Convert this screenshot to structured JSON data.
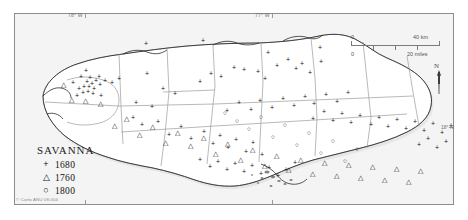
{
  "figure": {
    "credit": "© Carto ANU 08-004"
  },
  "legend": {
    "title": "SAVANNA",
    "entries": [
      {
        "symbol": "+",
        "glyph_name": "plus-symbol",
        "label": "1680"
      },
      {
        "symbol": "△",
        "glyph_name": "triangle-symbol",
        "label": "1760"
      },
      {
        "symbol": "○",
        "glyph_name": "circle-symbol",
        "label": "1800"
      }
    ]
  },
  "graticule": {
    "longitude_labels": [
      {
        "text": "78° W",
        "x": 70
      },
      {
        "text": "77° W",
        "x": 257
      }
    ],
    "latitude_labels": [
      {
        "text": "18° N",
        "y": 126
      }
    ]
  },
  "scale_bar": {
    "km_min": "0",
    "km_max": "40 km",
    "mi_min": "0",
    "mi_max": "20 miles"
  },
  "north_arrow": {
    "label": "N"
  },
  "chart_data": {
    "type": "scatter",
    "title": "SAVANNA",
    "xlabel": "Longitude",
    "ylabel": "Latitude",
    "series": [
      {
        "name": "1680",
        "symbol": "+",
        "points": [
          [
            65,
            66
          ],
          [
            72,
            70
          ],
          [
            78,
            66
          ],
          [
            82,
            72
          ],
          [
            69,
            76
          ],
          [
            74,
            77
          ],
          [
            79,
            74
          ],
          [
            85,
            76
          ],
          [
            88,
            70
          ],
          [
            92,
            74
          ],
          [
            76,
            82
          ],
          [
            81,
            80
          ],
          [
            86,
            84
          ],
          [
            71,
            80
          ],
          [
            95,
            79
          ],
          [
            100,
            73
          ],
          [
            63,
            83
          ],
          [
            90,
            88
          ],
          [
            106,
            82
          ],
          [
            112,
            77
          ],
          [
            120,
            93
          ],
          [
            128,
            86
          ],
          [
            134,
            100
          ],
          [
            141,
            96
          ],
          [
            118,
            108
          ],
          [
            126,
            116
          ],
          [
            148,
            104
          ],
          [
            156,
            98
          ],
          [
            163,
            110
          ],
          [
            171,
            88
          ],
          [
            178,
            96
          ],
          [
            186,
            105
          ],
          [
            193,
            90
          ],
          [
            201,
            112
          ],
          [
            208,
            98
          ],
          [
            214,
            120
          ],
          [
            221,
            108
          ],
          [
            229,
            100
          ],
          [
            236,
            118
          ],
          [
            244,
            106
          ],
          [
            252,
            124
          ],
          [
            188,
            140
          ],
          [
            196,
            148
          ],
          [
            205,
            142
          ],
          [
            213,
            150
          ],
          [
            222,
            144
          ],
          [
            231,
            152
          ],
          [
            240,
            146
          ],
          [
            248,
            154
          ],
          [
            258,
            140
          ],
          [
            266,
            148
          ],
          [
            274,
            136
          ],
          [
            282,
            144
          ],
          [
            291,
            130
          ],
          [
            299,
            138
          ],
          [
            307,
            120
          ],
          [
            315,
            128
          ],
          [
            323,
            112
          ],
          [
            331,
            120
          ],
          [
            339,
            104
          ],
          [
            347,
            112
          ],
          [
            281,
            96
          ],
          [
            289,
            104
          ],
          [
            297,
            88
          ],
          [
            305,
            96
          ],
          [
            160,
            52
          ],
          [
            171,
            44
          ],
          [
            243,
            48
          ],
          [
            262,
            56
          ],
          [
            313,
            42
          ],
          [
            330,
            52
          ],
          [
            349,
            62
          ],
          [
            358,
            72
          ],
          [
            366,
            60
          ],
          [
            374,
            80
          ],
          [
            383,
            68
          ],
          [
            391,
            88
          ],
          [
            400,
            76
          ],
          [
            408,
            96
          ],
          [
            398,
            118
          ],
          [
            406,
            108
          ],
          [
            414,
            126
          ],
          [
            422,
            116
          ]
        ]
      },
      {
        "name": "1760",
        "symbol": "△",
        "points": [
          [
            48,
            72
          ],
          [
            56,
            88
          ],
          [
            82,
            88
          ],
          [
            90,
            92
          ],
          [
            104,
            112
          ],
          [
            116,
            104
          ],
          [
            130,
            122
          ],
          [
            142,
            114
          ],
          [
            154,
            130
          ],
          [
            166,
            120
          ],
          [
            178,
            134
          ],
          [
            190,
            126
          ],
          [
            202,
            142
          ],
          [
            214,
            132
          ],
          [
            226,
            148
          ],
          [
            238,
            138
          ],
          [
            250,
            154
          ],
          [
            262,
            144
          ],
          [
            274,
            158
          ],
          [
            286,
            148
          ],
          [
            298,
            162
          ],
          [
            310,
            150
          ],
          [
            322,
            164
          ],
          [
            334,
            152
          ],
          [
            346,
            166
          ],
          [
            358,
            154
          ],
          [
            370,
            168
          ],
          [
            382,
            156
          ],
          [
            394,
            170
          ],
          [
            406,
            158
          ]
        ]
      },
      {
        "name": "1800",
        "symbol": "○",
        "points": [
          [
            212,
            100
          ],
          [
            224,
            108
          ],
          [
            236,
            116
          ],
          [
            248,
            104
          ],
          [
            260,
            124
          ],
          [
            272,
            112
          ],
          [
            284,
            132
          ],
          [
            296,
            120
          ],
          [
            308,
            140
          ],
          [
            320,
            128
          ],
          [
            332,
            148
          ],
          [
            344,
            136
          ]
        ]
      }
    ]
  },
  "symbols": {
    "plus": [
      [
        131,
        29
      ],
      [
        188,
        26
      ],
      [
        253,
        38
      ],
      [
        305,
        33
      ],
      [
        71,
        56
      ],
      [
        58,
        68
      ],
      [
        66,
        62
      ],
      [
        72,
        67
      ],
      [
        75,
        63
      ],
      [
        69,
        72
      ],
      [
        64,
        74
      ],
      [
        74,
        72
      ],
      [
        77,
        69
      ],
      [
        81,
        66
      ],
      [
        79,
        74
      ],
      [
        84,
        62
      ],
      [
        85,
        70
      ],
      [
        90,
        66
      ],
      [
        68,
        78
      ],
      [
        73,
        77
      ],
      [
        78,
        79
      ],
      [
        62,
        81
      ],
      [
        86,
        81
      ],
      [
        97,
        68
      ],
      [
        104,
        64
      ],
      [
        132,
        59
      ],
      [
        148,
        74
      ],
      [
        160,
        79
      ],
      [
        185,
        67
      ],
      [
        196,
        59
      ],
      [
        206,
        62
      ],
      [
        219,
        53
      ],
      [
        229,
        55
      ],
      [
        243,
        57
      ],
      [
        250,
        64
      ],
      [
        262,
        51
      ],
      [
        273,
        45
      ],
      [
        281,
        54
      ],
      [
        287,
        49
      ],
      [
        295,
        58
      ],
      [
        306,
        47
      ],
      [
        121,
        88
      ],
      [
        137,
        92
      ],
      [
        118,
        103
      ],
      [
        127,
        110
      ],
      [
        143,
        107
      ],
      [
        154,
        120
      ],
      [
        166,
        112
      ],
      [
        176,
        124
      ],
      [
        189,
        117
      ],
      [
        198,
        129
      ],
      [
        205,
        121
      ],
      [
        213,
        133
      ],
      [
        221,
        125
      ],
      [
        231,
        137
      ],
      [
        238,
        128
      ],
      [
        247,
        140
      ],
      [
        212,
        96
      ],
      [
        224,
        88
      ],
      [
        236,
        95
      ],
      [
        245,
        86
      ],
      [
        257,
        93
      ],
      [
        268,
        84
      ],
      [
        279,
        91
      ],
      [
        290,
        82
      ],
      [
        299,
        89
      ],
      [
        311,
        80
      ],
      [
        322,
        87
      ],
      [
        333,
        78
      ],
      [
        298,
        104
      ],
      [
        309,
        97
      ],
      [
        318,
        106
      ],
      [
        327,
        99
      ],
      [
        336,
        108
      ],
      [
        345,
        101
      ],
      [
        356,
        110
      ],
      [
        364,
        103
      ],
      [
        373,
        112
      ],
      [
        382,
        105
      ],
      [
        391,
        114
      ],
      [
        400,
        107
      ],
      [
        409,
        116
      ],
      [
        418,
        109
      ],
      [
        427,
        118
      ],
      [
        436,
        111
      ],
      [
        404,
        130
      ],
      [
        413,
        124
      ],
      [
        422,
        133
      ],
      [
        431,
        127
      ],
      [
        185,
        145
      ],
      [
        195,
        152
      ],
      [
        203,
        147
      ],
      [
        212,
        155
      ],
      [
        220,
        149
      ],
      [
        229,
        157
      ],
      [
        237,
        151
      ],
      [
        246,
        159
      ],
      [
        254,
        153
      ],
      [
        263,
        161
      ],
      [
        271,
        155
      ],
      [
        280,
        148
      ]
    ],
    "triangle": [
      [
        48,
        71
      ],
      [
        56,
        86
      ],
      [
        70,
        87
      ],
      [
        85,
        90
      ],
      [
        99,
        112
      ],
      [
        111,
        105
      ],
      [
        124,
        121
      ],
      [
        137,
        113
      ],
      [
        150,
        129
      ],
      [
        162,
        119
      ],
      [
        175,
        132
      ],
      [
        188,
        124
      ],
      [
        200,
        140
      ],
      [
        212,
        130
      ],
      [
        225,
        146
      ],
      [
        237,
        136
      ],
      [
        249,
        152
      ],
      [
        261,
        142
      ],
      [
        273,
        156
      ],
      [
        285,
        146
      ],
      [
        297,
        160
      ],
      [
        309,
        149
      ],
      [
        321,
        162
      ],
      [
        333,
        151
      ],
      [
        345,
        164
      ],
      [
        357,
        153
      ],
      [
        369,
        166
      ],
      [
        381,
        155
      ],
      [
        393,
        168
      ],
      [
        405,
        157
      ]
    ],
    "circle": [
      [
        210,
        99
      ],
      [
        222,
        107
      ],
      [
        234,
        115
      ],
      [
        246,
        103
      ],
      [
        258,
        123
      ],
      [
        270,
        111
      ],
      [
        282,
        131
      ],
      [
        294,
        119
      ],
      [
        306,
        139
      ],
      [
        318,
        127
      ],
      [
        330,
        147
      ],
      [
        342,
        135
      ]
    ]
  }
}
